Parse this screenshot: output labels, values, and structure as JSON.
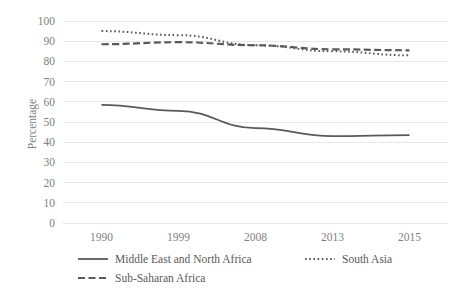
{
  "chart_data": {
    "type": "line",
    "title": "",
    "subtitle": "",
    "xlabel": "",
    "ylabel": "Percentage",
    "categories": [
      "1990",
      "1999",
      "2008",
      "2013",
      "2015"
    ],
    "ylim": [
      0,
      100
    ],
    "yticks": [
      "0",
      "10",
      "20",
      "30",
      "40",
      "50",
      "60",
      "70",
      "80",
      "90",
      "100"
    ],
    "grid": "horizontal",
    "legend_position": "bottom",
    "series": [
      {
        "name": "Middle East and North Africa",
        "style": "solid",
        "color": "#595959",
        "values": [
          58.5,
          55.5,
          47.0,
          43.0,
          43.5
        ]
      },
      {
        "name": "South Asia",
        "style": "dotted",
        "color": "#595959",
        "values": [
          95.0,
          93.0,
          88.0,
          85.0,
          83.0
        ]
      },
      {
        "name": "Sub-Saharan Africa",
        "style": "dashed",
        "color": "#595959",
        "values": [
          88.5,
          89.5,
          88.0,
          86.0,
          85.5
        ]
      }
    ]
  },
  "legend": {
    "items": [
      {
        "label": "Middle East and North Africa"
      },
      {
        "label": "South Asia"
      },
      {
        "label": "Sub-Saharan Africa"
      }
    ]
  }
}
